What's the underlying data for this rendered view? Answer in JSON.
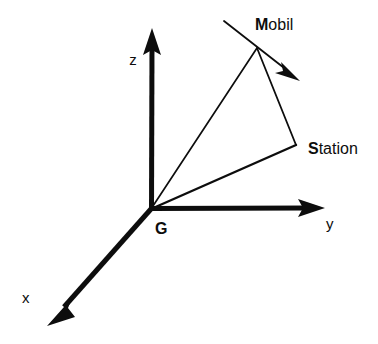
{
  "figure": {
    "background_color": "#ffffff",
    "stroke_color": "#0d0d0d",
    "width": 378,
    "height": 344
  },
  "axes": {
    "origin_label": "G",
    "items": [
      {
        "id": "z",
        "label": "z",
        "label_x": 133,
        "label_y": 65,
        "from_x": 151,
        "from_y": 209,
        "to_x": 152,
        "to_y": 31,
        "arrow": "arrowhead-up",
        "width": 5
      },
      {
        "id": "y",
        "label": "y",
        "label_x": 330,
        "label_y": 227,
        "from_x": 151,
        "from_y": 209,
        "to_x": 324,
        "to_y": 208,
        "arrow": "arrowhead-right",
        "width": 5
      },
      {
        "id": "x",
        "label": "x",
        "label_x": 22,
        "label_y": 301,
        "from_x": 151,
        "from_y": 209,
        "to_x": 49,
        "to_y": 324,
        "arrow": "arrowhead-down-left",
        "width": 5
      }
    ]
  },
  "points": [
    {
      "id": "mobil",
      "label_bold": "M",
      "label_rest": "obil",
      "label_x": 255,
      "label_y": 30,
      "x": 257,
      "y": 48
    },
    {
      "id": "station",
      "label_bold": "S",
      "label_rest": "tation",
      "label_x": 308,
      "label_y": 154,
      "x": 296,
      "y": 145
    }
  ],
  "origin": {
    "id": "G",
    "label": "G",
    "label_x": 155,
    "label_y": 233,
    "x": 151,
    "y": 209
  },
  "vectors": [
    {
      "id": "g-to-mobil",
      "from": "origin",
      "to": "mobil",
      "width": 1.6
    },
    {
      "id": "g-to-station",
      "from": "origin",
      "to": "station",
      "width": 2.2
    },
    {
      "id": "mobil-to-station",
      "from": "mobil",
      "to": "station",
      "width": 1.6
    }
  ],
  "velocity_arrow": {
    "id": "mobil-velocity",
    "from_x": 224,
    "from_y": 21,
    "to_x": 299,
    "to_y": 80,
    "width": 1.6,
    "arrow": "arrowhead-velocity"
  }
}
